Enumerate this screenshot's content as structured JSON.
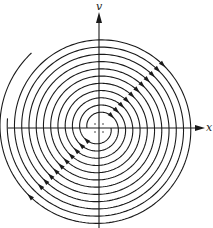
{
  "figure": {
    "type": "phase-portrait",
    "axes": {
      "x_label": "x",
      "y_label": "v",
      "origin_px": [
        99,
        128
      ],
      "x_axis_px": [
        8,
        205
      ],
      "y_axis_px": [
        228,
        12
      ]
    },
    "spiral": {
      "arms": 2,
      "direction": "clockwise",
      "start_radius_px": 12,
      "growth_per_turn_px": 14.5,
      "arm_offsets_deg": [
        0,
        180
      ],
      "arm_end_radius_px": [
        89,
        98
      ],
      "arrow_angles_deg": [
        -45,
        135
      ]
    },
    "center_markers": 4,
    "colors": {
      "stroke": "#1a1a1a",
      "background": "#ffffff"
    }
  }
}
